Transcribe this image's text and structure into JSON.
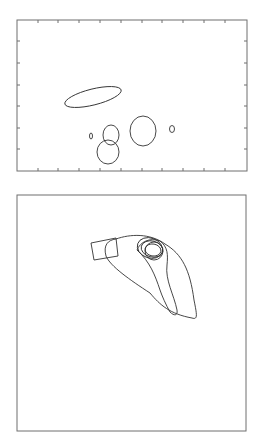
{
  "figure": {
    "background": "#ffffff",
    "line_color": "#333333",
    "frame_color": "#6f6f6f",
    "panels": [
      {
        "id": "top-panel",
        "description": "Contour plot with tick marks on all four sides, no labels",
        "frame": {
          "x": 17,
          "y": 20,
          "width": 230,
          "height": 151
        },
        "ticks": {
          "x_positions": [
            38,
            58,
            79,
            100,
            121,
            142,
            162,
            183,
            204,
            225
          ],
          "y_positions": [
            41,
            63,
            85,
            106,
            128,
            149
          ],
          "labels": []
        },
        "contours": [
          {
            "name": "elongated-ellipse",
            "cx": 93,
            "cy": 97,
            "rx": 29,
            "ry": 8,
            "rotation": -14
          },
          {
            "name": "tiny-loop-left",
            "cx": 91,
            "cy": 136,
            "rx": 1.5,
            "ry": 3
          },
          {
            "name": "upper-circle",
            "cx": 111,
            "cy": 135,
            "rx": 8,
            "ry": 10
          },
          {
            "name": "lower-blob",
            "cx": 108,
            "cy": 152,
            "rx": 11,
            "ry": 12
          },
          {
            "name": "middle-blob",
            "cx": 143,
            "cy": 131,
            "rx": 13,
            "ry": 15
          },
          {
            "name": "tiny-loop-right",
            "cx": 172,
            "cy": 129,
            "rx": 2.5,
            "ry": 3.5
          }
        ]
      },
      {
        "id": "bottom-panel",
        "description": "Contour plot with no tick marks or labels; a small rectangle and several nested loops",
        "frame": {
          "x": 17,
          "y": 195,
          "width": 229,
          "height": 236
        },
        "ticks": {
          "x_positions": [],
          "y_positions": [],
          "labels": []
        },
        "contours": [
          {
            "name": "small-rectangle",
            "points": "91,243 116,238 118,256 94,260"
          },
          {
            "name": "outer-elongated-loop",
            "path": "M116,239 C130,234 150,233 165,244 C182,254 190,270 194,300 C197,315 198,320 192,318 C170,314 160,305 150,293 C130,280 110,266 106,256 C103,245 108,240 116,239 Z"
          },
          {
            "name": "middle-loop",
            "path": "M137,250 C140,242 150,237 160,241 C168,247 168,255 167,265 C165,280 174,295 177,310 C178,316 174,316 170,312 C166,305 162,296 160,290 C155,275 150,262 137,250 Z"
          },
          {
            "name": "core-loop-1",
            "cx": 152,
            "cy": 249,
            "rx": 11,
            "ry": 8,
            "rotation": 15
          },
          {
            "name": "core-loop-2",
            "cx": 153,
            "cy": 250,
            "rx": 8,
            "ry": 6,
            "rotation": 10
          },
          {
            "name": "core-loop-3",
            "cx": 150,
            "cy": 248,
            "rx": 13,
            "ry": 10,
            "rotation": 20
          },
          {
            "name": "core-loop-4",
            "cx": 154,
            "cy": 251,
            "rx": 9,
            "ry": 9,
            "rotation": 0
          }
        ]
      }
    ]
  }
}
